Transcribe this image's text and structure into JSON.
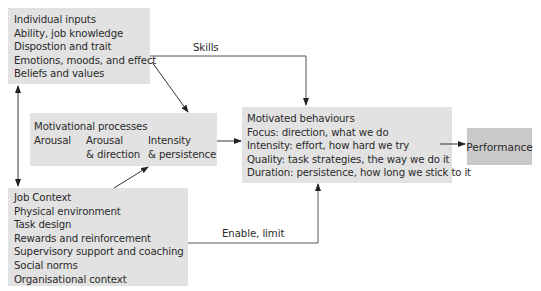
{
  "individual_inputs": {
    "lines": [
      "Individual inputs",
      "Ability, job knowledge",
      "Dispostion and trait",
      "Emotions, moods, and effect",
      "Beliefs and values"
    ]
  },
  "motivational_processes": {
    "title": "Motivational processes",
    "columns": [
      {
        "line1": "Arousal",
        "line2": ""
      },
      {
        "line1": "Arousal",
        "line2": "& direction"
      },
      {
        "line1": "Intensity",
        "line2": "& persistence"
      }
    ]
  },
  "job_context": {
    "lines": [
      "Job Context",
      "Physical environment",
      "Task design",
      "Rewards and reinforcement",
      "Supervisory support and coaching",
      "Social norms",
      "Organisational context"
    ]
  },
  "motivated_behaviours": {
    "lines": [
      "Motivated behaviours",
      "Focus: direction, what we do",
      "Intensity: effort, how hard we try",
      "Quality: task strategies, the way we do it",
      "Duration: persistence, how long we stick to it"
    ]
  },
  "performance": {
    "label": "Performance"
  },
  "edges": {
    "skills": "Skills",
    "enable_limit": "Enable, limit"
  },
  "colors": {
    "box_fill": "#e2e2e2",
    "performance_fill": "#c9c9c9",
    "line": "#333333"
  }
}
